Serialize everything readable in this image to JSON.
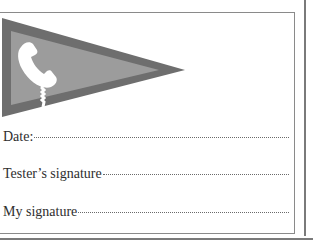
{
  "page": {
    "cropped_top_text": "· · · · · · · ·"
  },
  "card": {
    "pennant": {
      "icon": "telephone-handset-icon",
      "outer_color": "#6e6e6e",
      "inner_color": "#9a9a9a",
      "icon_color": "#ffffff"
    },
    "fields": [
      {
        "label": "Date:"
      },
      {
        "label": "Tester’s signature"
      },
      {
        "label": "My signature"
      }
    ]
  }
}
